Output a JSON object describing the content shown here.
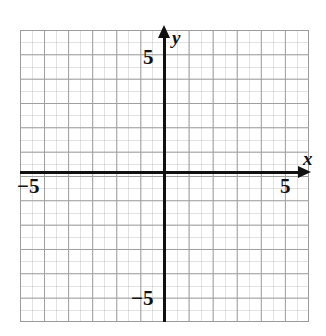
{
  "figure": {
    "kind": "cartesian-coordinate-plane",
    "background_color": "#ffffff",
    "axis_color": "#111111",
    "grid_color": "#9b9b9b"
  },
  "axes": {
    "x": {
      "name": "x",
      "arrow": "right",
      "labels": {
        "positive": "5",
        "negative": "−5"
      }
    },
    "y": {
      "name": "y",
      "arrow": "up",
      "labels": {
        "positive": "5",
        "negative": "−5"
      }
    }
  },
  "chart_data": {
    "type": "scatter",
    "title": "",
    "subtitle": "",
    "xlabel": "x",
    "ylabel": "y",
    "xlim": [
      -6,
      6
    ],
    "ylim": [
      -6,
      6
    ],
    "xticks": [
      -5,
      5
    ],
    "xticklabels": [
      "−5",
      "5"
    ],
    "yticks": [
      -5,
      5
    ],
    "yticklabels": [
      "−5",
      "5"
    ],
    "grid": true,
    "grid_spacing": 1,
    "grid_columns": 12,
    "grid_rows": 12,
    "legend": null,
    "series": [],
    "annotations": []
  }
}
